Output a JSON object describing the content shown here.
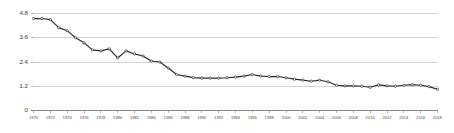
{
  "chart_data": {
    "type": "line",
    "title": "",
    "subtitle": "",
    "xlabel": "",
    "ylabel": "",
    "grid": true,
    "legend": false,
    "legend_position": "none",
    "marker": "open-circle",
    "line_color": "#2b2b2b",
    "grid_color": "#c9c9c9",
    "axis_color": "#8a8a8a",
    "background": "#ffffff",
    "xlim": [
      1970,
      2018
    ],
    "ylim": [
      0,
      4.8
    ],
    "ytick_labels": [
      "0",
      "1.2",
      "2.4",
      "3.6",
      "4.8"
    ],
    "ytick_values": [
      0,
      1.2,
      2.4,
      3.6,
      4.8
    ],
    "xtick_labels": [
      "1970",
      "1972",
      "1974",
      "1976",
      "1978",
      "1980",
      "1982",
      "1984",
      "1986",
      "1988",
      "1990",
      "1992",
      "1994",
      "1996",
      "1998",
      "2000",
      "2002",
      "2004",
      "2006",
      "2008",
      "2010",
      "2012",
      "2014",
      "2016",
      "2018"
    ],
    "xtick_values": [
      1970,
      1972,
      1974,
      1976,
      1978,
      1980,
      1982,
      1984,
      1986,
      1988,
      1990,
      1992,
      1994,
      1996,
      1998,
      2000,
      2002,
      2004,
      2006,
      2008,
      2010,
      2012,
      2014,
      2016,
      2018
    ],
    "x": [
      1970,
      1971,
      1972,
      1973,
      1974,
      1975,
      1976,
      1977,
      1978,
      1979,
      1980,
      1981,
      1982,
      1983,
      1984,
      1985,
      1986,
      1987,
      1988,
      1989,
      1990,
      1991,
      1992,
      1993,
      1994,
      1995,
      1996,
      1997,
      1998,
      1999,
      2000,
      2001,
      2002,
      2003,
      2004,
      2005,
      2006,
      2007,
      2008,
      2009,
      2010,
      2011,
      2012,
      2013,
      2014,
      2015,
      2016,
      2017,
      2018
    ],
    "values": [
      4.55,
      4.55,
      4.5,
      4.1,
      3.95,
      3.6,
      3.35,
      3.0,
      2.95,
      3.05,
      2.6,
      2.95,
      2.8,
      2.7,
      2.45,
      2.4,
      2.1,
      1.78,
      1.7,
      1.63,
      1.6,
      1.6,
      1.6,
      1.62,
      1.65,
      1.7,
      1.78,
      1.7,
      1.68,
      1.68,
      1.62,
      1.55,
      1.5,
      1.45,
      1.5,
      1.42,
      1.25,
      1.22,
      1.22,
      1.2,
      1.15,
      1.27,
      1.22,
      1.2,
      1.25,
      1.28,
      1.25,
      1.18,
      1.05
    ],
    "series": [
      {
        "name": "series-1",
        "values": [
          4.55,
          4.55,
          4.5,
          4.1,
          3.95,
          3.6,
          3.35,
          3.0,
          2.95,
          3.05,
          2.6,
          2.95,
          2.8,
          2.7,
          2.45,
          2.4,
          2.1,
          1.78,
          1.7,
          1.63,
          1.6,
          1.6,
          1.6,
          1.62,
          1.65,
          1.7,
          1.78,
          1.7,
          1.68,
          1.68,
          1.62,
          1.55,
          1.5,
          1.45,
          1.5,
          1.42,
          1.25,
          1.22,
          1.22,
          1.2,
          1.15,
          1.27,
          1.22,
          1.2,
          1.25,
          1.28,
          1.25,
          1.18,
          1.05
        ]
      }
    ],
    "annotations": []
  }
}
